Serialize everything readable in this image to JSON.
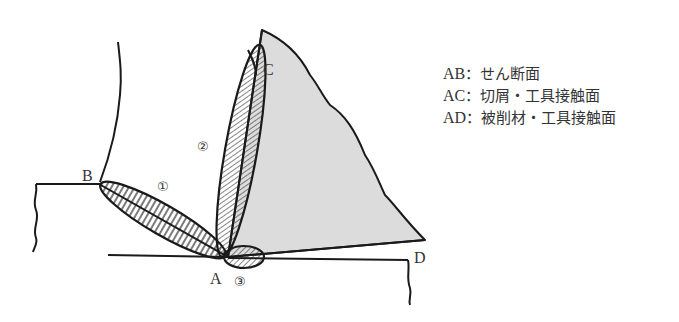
{
  "diagram": {
    "points": {
      "A": "A",
      "B": "B",
      "C": "C",
      "D": "D"
    },
    "regions": {
      "r1": "①",
      "r2": "②",
      "r3": "③"
    },
    "colors": {
      "line": "#1a1a1a",
      "tool_fill": "#dcdcdc",
      "hatch": "#222222",
      "text": "#333333"
    }
  },
  "legend": {
    "items": [
      {
        "key": "AB",
        "sep": "：",
        "label": "せん断面"
      },
      {
        "key": "AC",
        "sep": "：",
        "label": "切屑・工具接触面"
      },
      {
        "key": "AD",
        "sep": "：",
        "label": "被削材・工具接触面"
      }
    ]
  }
}
